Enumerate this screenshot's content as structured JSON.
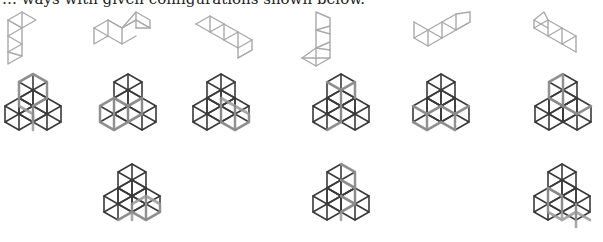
{
  "caption": "… ways with given configurations shown below.",
  "colors": {
    "piece_stroke": "#a9a9a9",
    "figure_stroke": "#3a3a3a",
    "highlight_stroke": "#9a9a9a"
  },
  "rows": [
    {
      "name": "pieces",
      "items": [
        {
          "id": "piece-1",
          "shape": "vertical-strip-with-top-flag"
        },
        {
          "id": "piece-2",
          "shape": "zigzag-strip"
        },
        {
          "id": "piece-3",
          "shape": "v-strip"
        },
        {
          "id": "piece-4",
          "shape": "vertical-strip-with-bottom-flag"
        },
        {
          "id": "piece-5",
          "shape": "m-strip"
        },
        {
          "id": "piece-6",
          "shape": "hook-strip"
        }
      ]
    },
    {
      "name": "solutions-row-1",
      "items": [
        {
          "id": "solution-1"
        },
        {
          "id": "solution-2"
        },
        {
          "id": "solution-3"
        },
        {
          "id": "solution-4"
        },
        {
          "id": "solution-5"
        },
        {
          "id": "solution-6"
        }
      ]
    },
    {
      "name": "solutions-row-2",
      "items": [
        {
          "id": "solution-7"
        },
        {
          "id": "solution-8"
        },
        {
          "id": "solution-9"
        }
      ]
    }
  ]
}
